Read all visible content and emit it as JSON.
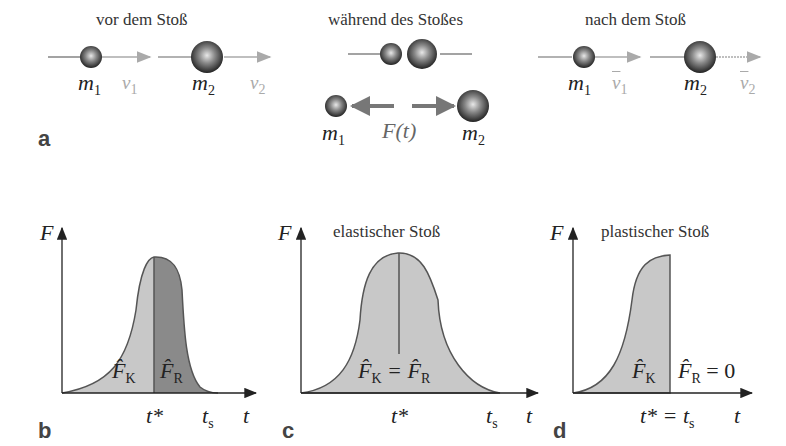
{
  "panel_a": {
    "letter": "a",
    "before": {
      "caption": "vor dem Stoß",
      "m1": "m",
      "m1_sub": "1",
      "v1": "v",
      "v1_sub": "1",
      "m2": "m",
      "m2_sub": "2",
      "v2": "v",
      "v2_sub": "2"
    },
    "during": {
      "caption": "während des Stoßes",
      "m1": "m",
      "m1_sub": "1",
      "m2": "m",
      "m2_sub": "2",
      "force": "F(t)"
    },
    "after": {
      "caption": "nach dem Stoß",
      "m1": "m",
      "m1_sub": "1",
      "v1": "v",
      "v1_sub": "1",
      "m2": "m",
      "m2_sub": "2",
      "v2": "v",
      "v2_sub": "2"
    }
  },
  "panel_b": {
    "letter": "b",
    "y_axis": "F",
    "x_axis": "t",
    "label_fk": "F̂",
    "fk_sub": "K",
    "label_fr": "F̂",
    "fr_sub": "R",
    "tick_tstar": "t*",
    "tick_ts": "t",
    "ts_sub": "s"
  },
  "panel_c": {
    "letter": "c",
    "title": "elastischer Stoß",
    "y_axis": "F",
    "x_axis": "t",
    "equation": "F̂",
    "eq_sub1": "K",
    "eq_mid": " = F̂",
    "eq_sub2": "R",
    "tick_tstar": "t*",
    "tick_ts": "t",
    "ts_sub": "s"
  },
  "panel_d": {
    "letter": "d",
    "title": "plastischer Stoß",
    "y_axis": "F",
    "x_axis": "t",
    "label_fk": "F̂",
    "fk_sub": "K",
    "label_fr": "F̂",
    "fr_sub": "R",
    "fr_eq": " = 0",
    "tick": "t* = t",
    "tick_sub": "s"
  },
  "colors": {
    "light_fill": "#c8c8c8",
    "dark_fill": "#8a8a8a",
    "outline": "#555555",
    "arrow_gray": "#aaaaaa",
    "force_arrow": "#777777"
  }
}
